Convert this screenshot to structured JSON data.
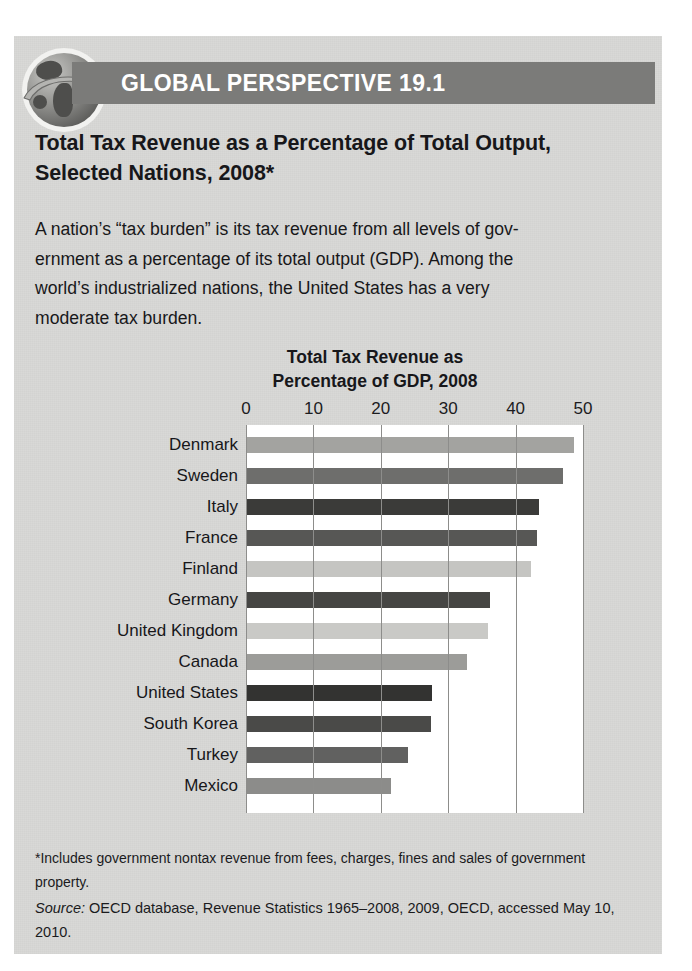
{
  "header": {
    "band_title": "GLOBAL PERSPECTIVE 19.1",
    "icon": "globe-arrow-icon",
    "band_color": "#7b7b79"
  },
  "headline": "Total Tax Revenue as a Percentage of Total Output, Selected Nations, 2008*",
  "body": {
    "line1": "A nation’s “tax burden” is its tax revenue from all levels of gov-",
    "line2": "ernment as a percentage of its total output (GDP). Among the",
    "line3": "world’s industrialized nations, the United States has a very",
    "line4": "moderate tax burden."
  },
  "footnote": "*Includes government nontax revenue from fees, charges, fines and sales of government property.",
  "source": {
    "label": "Source:",
    "text": " OECD database, Revenue Statistics 1965–2008, 2009, OECD, accessed May 10, 2010."
  },
  "chart_data": {
    "type": "bar",
    "orientation": "horizontal",
    "title": "Total Tax Revenue as Percentage of GDP, 2008",
    "title_line1": "Total Tax Revenue as",
    "title_line2": "Percentage of GDP, 2008",
    "xlabel": "",
    "ylabel": "",
    "xlim": [
      0,
      50
    ],
    "xticks": [
      0,
      10,
      20,
      30,
      40,
      50
    ],
    "xtick_labels": [
      "0",
      "10",
      "20",
      "30",
      "40",
      "50"
    ],
    "grid": true,
    "legend": "none",
    "categories": [
      "Denmark",
      "Sweden",
      "Italy",
      "France",
      "Finland",
      "Germany",
      "United Kingdom",
      "Canada",
      "United States",
      "South Korea",
      "Turkey",
      "Mexico"
    ],
    "values": [
      48.7,
      47.0,
      43.5,
      43.2,
      42.3,
      36.2,
      35.9,
      32.8,
      27.6,
      27.4,
      24.0,
      21.5
    ],
    "bar_colors": [
      "#a3a3a0",
      "#6e6e6c",
      "#3b3b39",
      "#575755",
      "#c5c5c2",
      "#454543",
      "#c9c9c6",
      "#9c9c99",
      "#333331",
      "#4a4a48",
      "#616160",
      "#8c8c8a"
    ],
    "plot_background": "#ffffff",
    "gridline_color": "#8d8d8b"
  }
}
